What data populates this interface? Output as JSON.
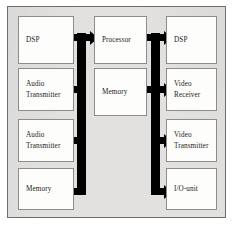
{
  "diagram": {
    "background_color": "#e3e1df",
    "box_color": "#fdfdfc",
    "bus_color": "#000000",
    "border_color": "#6e6e6e",
    "columns": {
      "left": {
        "name": "left-column",
        "nodes": [
          {
            "id": "left-dsp",
            "label": "DSP"
          },
          {
            "id": "left-audio-transmitter-1",
            "label": "Audio\nTransmitter"
          },
          {
            "id": "left-audio-transmitter-2",
            "label": "Audio\nTransmitter"
          },
          {
            "id": "left-memory",
            "label": "Memory"
          }
        ]
      },
      "center": {
        "name": "center-column",
        "nodes": [
          {
            "id": "processor",
            "label": "Processor"
          },
          {
            "id": "center-memory",
            "label": "Memory"
          }
        ]
      },
      "right": {
        "name": "right-column",
        "nodes": [
          {
            "id": "right-dsp",
            "label": "DSP"
          },
          {
            "id": "video-receiver",
            "label": "Video\nReceiver"
          },
          {
            "id": "video-transmitter",
            "label": "Video\nTransmitter"
          },
          {
            "id": "io-unit",
            "label": "I/O-unit"
          }
        ]
      }
    },
    "buses": [
      {
        "id": "left-bus",
        "name": "left-bus",
        "orientation": "vertical-trunk",
        "connects": [
          "left-dsp",
          "processor",
          "left-audio-transmitter-1",
          "left-audio-transmitter-2",
          "left-memory"
        ],
        "arrowheads": [
          "left",
          "right",
          "left",
          "left",
          "left"
        ]
      },
      {
        "id": "right-bus",
        "name": "right-bus",
        "orientation": "vertical-trunk",
        "connects": [
          "right-dsp",
          "processor",
          "video-receiver",
          "video-transmitter",
          "io-unit"
        ],
        "arrowheads": [
          "left",
          "right",
          "left",
          "right",
          "right"
        ]
      }
    ]
  }
}
